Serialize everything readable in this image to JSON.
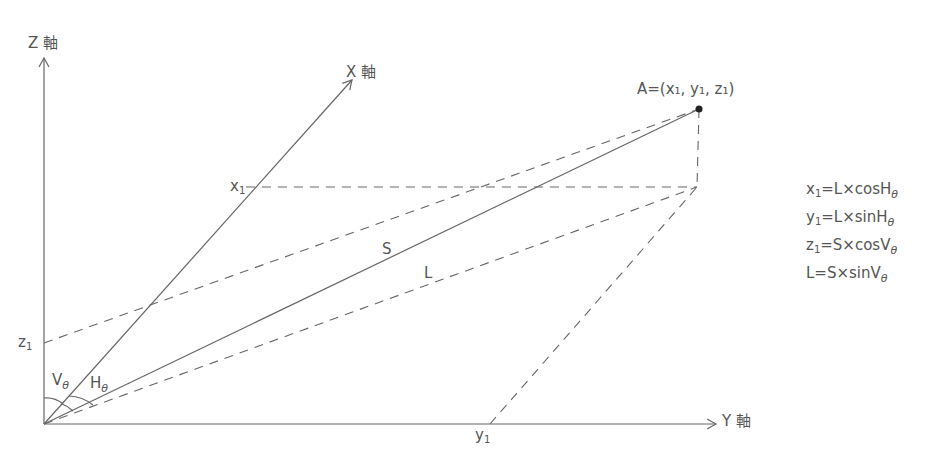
{
  "axes": {
    "z_label": "Z",
    "x_label": "X",
    "y_label": "Y",
    "axis_suffix": "軸"
  },
  "point": {
    "name": "A",
    "equals": "=",
    "coords_text": "(x₁, y₁, z₁)"
  },
  "labels": {
    "x1": "x",
    "y1": "y",
    "z1": "z",
    "subscript": "1",
    "S": "S",
    "L": "L",
    "V": "V",
    "H": "H",
    "theta": "θ"
  },
  "formulas": [
    {
      "lhs": "x",
      "lhs_sub": "1",
      "rhs": "=L×cosH",
      "theta": "θ"
    },
    {
      "lhs": "y",
      "lhs_sub": "1",
      "rhs": "=L×sinH",
      "theta": "θ"
    },
    {
      "lhs": "z",
      "lhs_sub": "1",
      "rhs": "=S×cosV",
      "theta": "θ"
    },
    {
      "lhs": "L",
      "lhs_sub": "",
      "rhs": "=S×sinV",
      "theta": "θ"
    }
  ]
}
